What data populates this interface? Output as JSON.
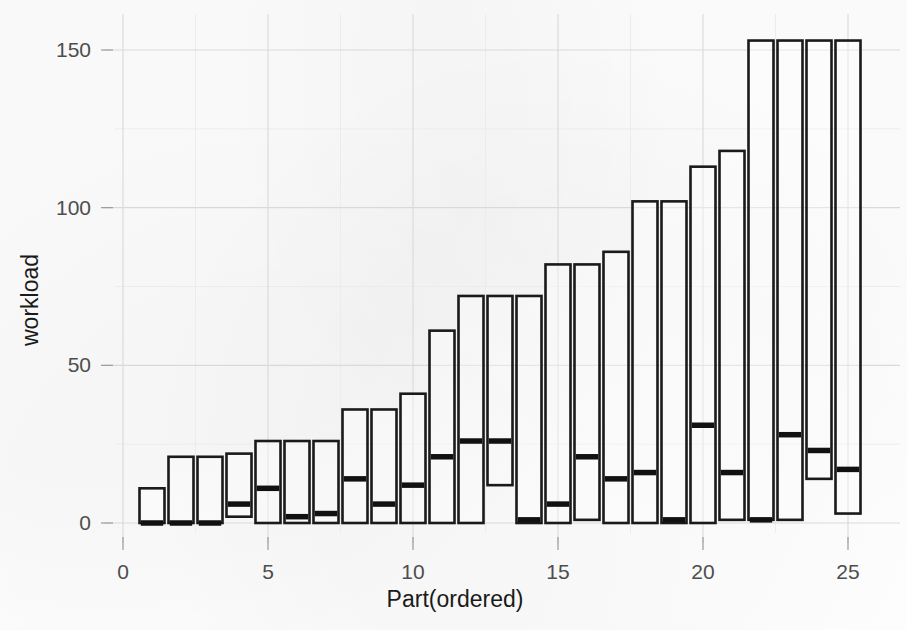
{
  "figure": {
    "background_color": "#fefefe",
    "ink_color": "#1a1a1a",
    "grid_color": "#d9d9d9",
    "tick_label_color": "#4d4d4d"
  },
  "chart_data": {
    "type": "bar",
    "title": "",
    "subtitle": "",
    "xlabel": "Part(ordered)",
    "ylabel": "workload",
    "xlim": [
      0.2,
      25.9
    ],
    "ylim": [
      -3,
      158
    ],
    "x_ticks": [
      0,
      5,
      10,
      15,
      20,
      25
    ],
    "x_tick_labels": [
      "0",
      "5",
      "10",
      "15",
      "20",
      "25"
    ],
    "y_ticks": [
      0,
      50,
      100,
      150
    ],
    "y_tick_labels": [
      "0",
      "50",
      "100",
      "150"
    ],
    "y_minor_ticks": [
      25,
      75,
      125
    ],
    "grid": true,
    "grid_axis": "both",
    "legend": false,
    "legend_position": "none",
    "annotations": [],
    "note": "Each vertical box spans from its lower value to its upper value; the heavy horizontal rule inside a box is the median.",
    "categories": [
      1,
      2,
      3,
      4,
      5,
      6,
      7,
      8,
      9,
      10,
      11,
      12,
      13,
      14,
      15,
      16,
      17,
      18,
      19,
      20,
      21,
      22,
      23,
      24,
      25
    ],
    "values": [
      11,
      21,
      21,
      22,
      26,
      26,
      26,
      36,
      36,
      41,
      61,
      72,
      72,
      72,
      82,
      82,
      86,
      102,
      102,
      113,
      118,
      153,
      153,
      153,
      153
    ],
    "series": [
      {
        "name": "box_lower",
        "values": [
          0,
          0,
          0,
          2,
          0,
          0,
          0,
          0,
          0,
          0,
          0,
          0,
          12,
          0,
          0,
          1,
          0,
          0,
          0,
          0,
          1,
          1,
          1,
          14,
          3
        ]
      },
      {
        "name": "box_upper",
        "values": [
          11,
          21,
          21,
          22,
          26,
          26,
          26,
          36,
          36,
          41,
          61,
          72,
          72,
          72,
          82,
          82,
          86,
          102,
          102,
          113,
          118,
          153,
          153,
          153,
          153
        ]
      },
      {
        "name": "median",
        "values": [
          0,
          0,
          0,
          6,
          11,
          2,
          3,
          14,
          6,
          12,
          21,
          26,
          26,
          1,
          6,
          21,
          14,
          16,
          1,
          31,
          16,
          1,
          28,
          23,
          17
        ]
      }
    ]
  }
}
